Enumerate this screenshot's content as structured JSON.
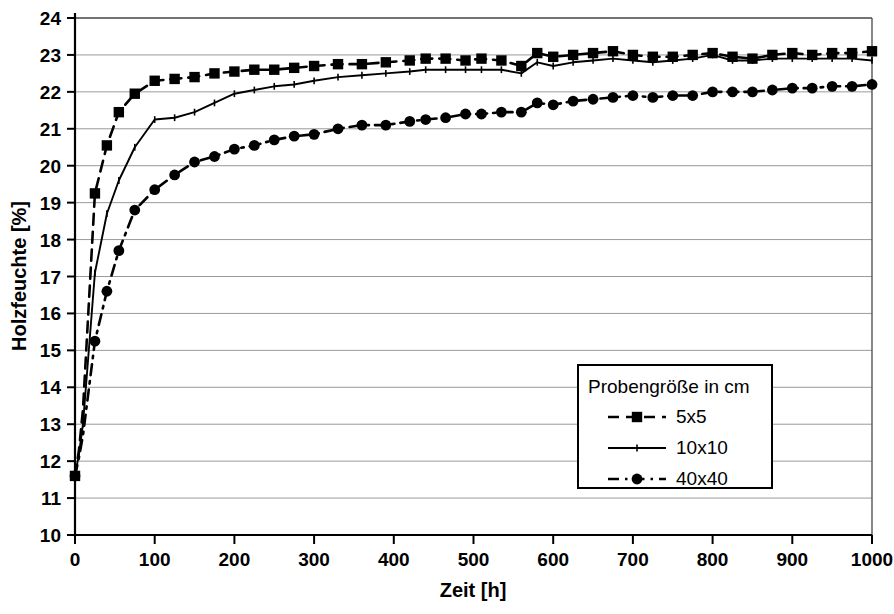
{
  "chart_data": {
    "type": "line",
    "title": "",
    "xlabel": "Zeit [h]",
    "ylabel": "Holzfeuchte [%]",
    "xlim": [
      0,
      1000
    ],
    "ylim": [
      10,
      24
    ],
    "xticks": [
      0,
      100,
      200,
      300,
      400,
      500,
      600,
      700,
      800,
      900,
      1000
    ],
    "yticks": [
      10,
      11,
      12,
      13,
      14,
      15,
      16,
      17,
      18,
      19,
      20,
      21,
      22,
      23,
      24
    ],
    "grid": "horizontal",
    "legend_position": "inside-lower-right",
    "legend_title": "Probengröße in cm",
    "series": [
      {
        "name": "5x5",
        "style": "dashed",
        "marker": "square",
        "x": [
          0,
          5,
          10,
          25,
          40,
          55,
          75,
          100,
          125,
          150,
          175,
          200,
          225,
          250,
          275,
          300,
          330,
          360,
          390,
          420,
          440,
          465,
          490,
          510,
          535,
          560,
          580,
          600,
          625,
          650,
          675,
          700,
          725,
          750,
          775,
          800,
          825,
          850,
          875,
          900,
          925,
          950,
          975,
          1000
        ],
        "y": [
          11.6,
          12.3,
          13.4,
          19.25,
          20.55,
          21.45,
          21.95,
          22.3,
          22.35,
          22.4,
          22.5,
          22.55,
          22.6,
          22.6,
          22.65,
          22.7,
          22.75,
          22.75,
          22.8,
          22.85,
          22.9,
          22.9,
          22.85,
          22.9,
          22.85,
          22.7,
          23.05,
          22.95,
          23.0,
          23.05,
          23.1,
          23.0,
          22.95,
          22.95,
          23.0,
          23.05,
          22.95,
          22.9,
          23.0,
          23.05,
          23.0,
          23.05,
          23.05,
          23.1
        ]
      },
      {
        "name": "10x10",
        "style": "solid",
        "marker": "tick",
        "x": [
          0,
          5,
          10,
          25,
          40,
          55,
          75,
          100,
          125,
          150,
          175,
          200,
          225,
          250,
          275,
          300,
          330,
          360,
          390,
          420,
          440,
          465,
          490,
          510,
          535,
          560,
          580,
          600,
          625,
          650,
          675,
          700,
          725,
          750,
          775,
          800,
          825,
          850,
          875,
          900,
          925,
          950,
          975,
          1000
        ],
        "y": [
          11.6,
          12.2,
          13.0,
          17.1,
          18.7,
          19.6,
          20.5,
          21.25,
          21.3,
          21.45,
          21.7,
          21.95,
          22.05,
          22.15,
          22.2,
          22.3,
          22.4,
          22.45,
          22.5,
          22.55,
          22.6,
          22.6,
          22.6,
          22.6,
          22.6,
          22.5,
          22.8,
          22.7,
          22.8,
          22.85,
          22.9,
          22.85,
          22.8,
          22.85,
          22.9,
          23.0,
          22.85,
          22.85,
          22.9,
          22.9,
          22.9,
          22.9,
          22.9,
          22.85
        ]
      },
      {
        "name": "40x40",
        "style": "dashdot",
        "marker": "circle",
        "x": [
          0,
          5,
          10,
          25,
          40,
          55,
          75,
          100,
          125,
          150,
          175,
          200,
          225,
          250,
          275,
          300,
          330,
          360,
          390,
          420,
          440,
          465,
          490,
          510,
          535,
          560,
          580,
          600,
          625,
          650,
          675,
          700,
          725,
          750,
          775,
          800,
          825,
          850,
          875,
          900,
          925,
          950,
          975,
          1000
        ],
        "y": [
          11.6,
          12.1,
          12.7,
          15.25,
          16.6,
          17.7,
          18.8,
          19.35,
          19.75,
          20.1,
          20.25,
          20.45,
          20.55,
          20.7,
          20.8,
          20.85,
          21.0,
          21.1,
          21.1,
          21.2,
          21.25,
          21.3,
          21.4,
          21.4,
          21.45,
          21.45,
          21.7,
          21.65,
          21.75,
          21.8,
          21.85,
          21.9,
          21.85,
          21.9,
          21.9,
          22.0,
          22.0,
          22.0,
          22.05,
          22.1,
          22.1,
          22.15,
          22.15,
          22.2
        ]
      }
    ]
  },
  "axes": {
    "y_title": "Holzfeuchte [%]",
    "x_title": "Zeit [h]",
    "y_tick_labels": [
      "24",
      "23",
      "22",
      "21",
      "20",
      "19",
      "18",
      "17",
      "16",
      "15",
      "14",
      "13",
      "12",
      "11",
      "10"
    ],
    "x_tick_labels": [
      "0",
      "100",
      "200",
      "300",
      "400",
      "500",
      "600",
      "700",
      "800",
      "900",
      "1000"
    ]
  },
  "legend": {
    "title": "Probengröße in cm",
    "entries": [
      {
        "label": "5x5",
        "style": "dashed",
        "marker": "square"
      },
      {
        "label": "10x10",
        "style": "solid",
        "marker": "tick"
      },
      {
        "label": "40x40",
        "style": "dashdot",
        "marker": "circle"
      }
    ]
  },
  "colors": {
    "line": "#000000",
    "grid": "#9a9a9a",
    "background": "#ffffff",
    "frame": "#555555"
  }
}
